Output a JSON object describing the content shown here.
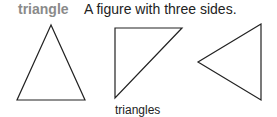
{
  "entry": {
    "term": "triangle",
    "definition": "A figure with three sides."
  },
  "figure": {
    "caption": "triangles",
    "shapes": [
      {
        "name": "isosceles-triangle",
        "points": "51,25 17,100 85,100"
      },
      {
        "name": "right-triangle",
        "points": "115,28 182,28 115,98"
      },
      {
        "name": "left-pointing-triangle",
        "points": "261,24 198,62 261,100"
      }
    ],
    "stroke_color": "#222222"
  }
}
